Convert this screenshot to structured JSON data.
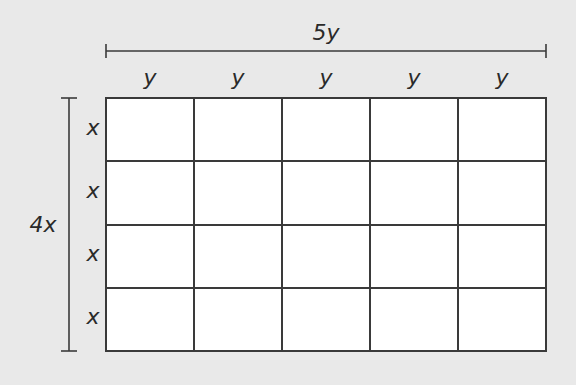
{
  "diagram": {
    "width_label": "5y",
    "height_label": "4x",
    "column_labels": [
      "y",
      "y",
      "y",
      "y",
      "y"
    ],
    "row_labels": [
      "x",
      "x",
      "x",
      "x"
    ],
    "grid": {
      "rows": 4,
      "cols": 5
    },
    "colors": {
      "background": "#e9e9e9",
      "cell_fill": "#ffffff",
      "line": "#3a3a3a"
    }
  }
}
